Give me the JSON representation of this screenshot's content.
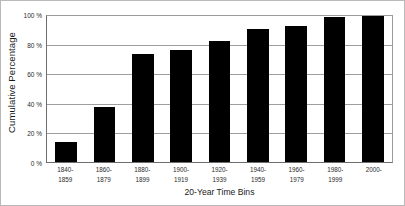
{
  "chart_data": {
    "type": "bar",
    "title": "",
    "xlabel": "20-Year Time Bins",
    "ylabel": "Cumulative Percentage",
    "categories": [
      "1840-1859",
      "1860-1879",
      "1880-1899",
      "1900-1919",
      "1920-1939",
      "1940-1959",
      "1960-1979",
      "1980-1999",
      "2000-"
    ],
    "category_lines": [
      [
        "1840-",
        "1859"
      ],
      [
        "1860-",
        "1879"
      ],
      [
        "1880-",
        "1899"
      ],
      [
        "1900-",
        "1919"
      ],
      [
        "1920-",
        "1939"
      ],
      [
        "1940-",
        "1959"
      ],
      [
        "1960-",
        "1979"
      ],
      [
        "1980-",
        "1999"
      ],
      [
        "2000-",
        ""
      ]
    ],
    "values": [
      14,
      38,
      74,
      77,
      83,
      91,
      93,
      99,
      100
    ],
    "ylim": [
      0,
      100
    ],
    "yticks": [
      0,
      20,
      40,
      60,
      80,
      100
    ],
    "ytick_labels": [
      "0 %",
      "20 %",
      "40 %",
      "60 %",
      "80 %",
      "100 %"
    ],
    "grid": true,
    "legend": "none",
    "bar_color": "#000000",
    "grid_color": "#9e9e9e",
    "axis_color": "#6e6e6e",
    "background_color": "#ffffff"
  }
}
